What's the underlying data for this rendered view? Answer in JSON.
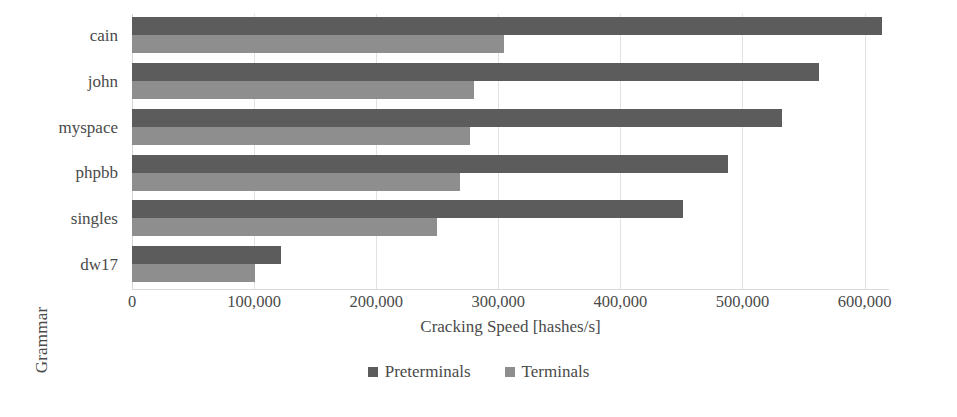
{
  "chart_data": {
    "type": "bar",
    "orientation": "horizontal",
    "title": "",
    "xlabel": "Cracking Speed [hashes/s]",
    "ylabel": "Grammar",
    "categories": [
      "cain",
      "john",
      "myspace",
      "phpbb",
      "singles",
      "dw17"
    ],
    "series": [
      {
        "name": "Preterminals",
        "color": "#5c5c5c",
        "values": [
          614000,
          563000,
          532000,
          488000,
          451000,
          122000
        ]
      },
      {
        "name": "Terminals",
        "color": "#8e8e8e",
        "values": [
          305000,
          280000,
          277000,
          269000,
          250000,
          101000
        ]
      }
    ],
    "xlim": [
      0,
      620000
    ],
    "xticks": [
      0,
      100000,
      200000,
      300000,
      400000,
      500000,
      600000
    ],
    "xtick_labels": [
      "0",
      "100,000",
      "200,000",
      "300,000",
      "400,000",
      "500,000",
      "600,000"
    ],
    "grid": true,
    "grid_axis": "x",
    "legend_position": "bottom"
  },
  "legend": {
    "items": [
      {
        "label": "Preterminals",
        "color": "#5c5c5c"
      },
      {
        "label": "Terminals",
        "color": "#8e8e8e"
      }
    ]
  }
}
